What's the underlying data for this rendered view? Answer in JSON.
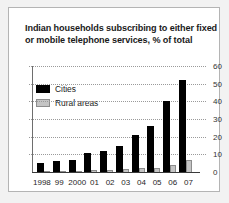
{
  "chart_data": {
    "type": "bar",
    "title": "Indian households subscribing to either fixed or mobile telephone services, % of total",
    "xlabel": "",
    "ylabel": "",
    "ylim": [
      0,
      60
    ],
    "yticks": [
      0,
      10,
      20,
      30,
      40,
      50,
      60
    ],
    "ytick_labels": [
      "0",
      "10",
      "20",
      "30",
      "40",
      "50",
      "60"
    ],
    "grid": true,
    "legend_position": "upper-left",
    "categories": [
      "1998",
      "99",
      "2000",
      "01",
      "02",
      "03",
      "04",
      "05",
      "06",
      "07"
    ],
    "series": [
      {
        "name": "Cities",
        "color": "#000000",
        "values": [
          5,
          6,
          7,
          10.5,
          12,
          15,
          21,
          26,
          40,
          52
        ]
      },
      {
        "name": "Rural areas",
        "color": "#c4c4c4",
        "values": [
          0.5,
          0.6,
          0.8,
          1,
          1.2,
          1.5,
          2,
          2,
          4,
          7
        ]
      }
    ]
  },
  "legend": {
    "items": [
      {
        "label": "Cities"
      },
      {
        "label": "Rural areas"
      }
    ]
  },
  "colors": {
    "cities": "#000000",
    "rural": "#c4c4c4",
    "frame_border": "#b4b4b4",
    "page_background": "#f2f2f2",
    "gridline": "#9a9a9a"
  }
}
